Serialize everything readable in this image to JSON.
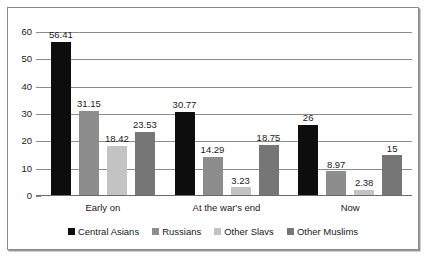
{
  "chart_data": {
    "type": "bar",
    "title": "",
    "subtitle": "",
    "xlabel": "",
    "ylabel": "",
    "ylim": [
      0,
      60
    ],
    "yticks": [
      0,
      10,
      20,
      30,
      40,
      50,
      60
    ],
    "grid": true,
    "legend_position": "bottom",
    "categories": [
      "Early on",
      "At the war's end",
      "Now"
    ],
    "series": [
      {
        "name": "Central Asians",
        "color": "#0d0d0d",
        "values": [
          56.41,
          30.77,
          26
        ],
        "labels": [
          "56.41",
          "30.77",
          "26"
        ]
      },
      {
        "name": "Russians",
        "color": "#8d8d8d",
        "values": [
          31.15,
          14.29,
          8.97
        ],
        "labels": [
          "31.15",
          "14.29",
          "8.97"
        ]
      },
      {
        "name": "Other Slavs",
        "color": "#c3c3c3",
        "values": [
          18.42,
          3.23,
          2.38
        ],
        "labels": [
          "18.42",
          "3.23",
          "2.38"
        ]
      },
      {
        "name": "Other Muslims",
        "color": "#767676",
        "values": [
          23.53,
          18.75,
          15
        ],
        "labels": [
          "23.53",
          "18.75",
          "15"
        ]
      }
    ]
  },
  "colors": {
    "frame_border": "#8a8a8a",
    "gridline": "#8c8c8c",
    "axis": "#6a6a6a",
    "text": "#1a1a1a",
    "background": "#ffffff"
  }
}
